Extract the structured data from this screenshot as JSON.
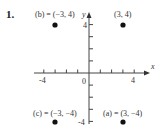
{
  "problem_number": "1.",
  "chart_data": {
    "type": "scatter",
    "title": "",
    "xlabel": "x",
    "ylabel": "y",
    "xlim": [
      -5,
      5
    ],
    "ylim": [
      -4,
      4
    ],
    "x_ticks": [
      -4,
      -3,
      -2,
      -1,
      1,
      2,
      3,
      4
    ],
    "x_tick_labels": [
      "-4",
      "0",
      "4"
    ],
    "y_ticks": [
      -4,
      -3,
      -2,
      -1,
      1,
      2,
      3,
      4
    ],
    "y_tick_labels": [
      "4",
      "-4"
    ],
    "grid": false,
    "points": [
      {
        "label": "(b) = (−3, 4)",
        "x": -3,
        "y": 4
      },
      {
        "label": "(3, 4)",
        "x": 3,
        "y": 4
      },
      {
        "label": "(c) = (−3, −4)",
        "x": -3,
        "y": -4
      },
      {
        "label": "(a) = (3, −4)",
        "x": 3,
        "y": -4
      }
    ]
  }
}
